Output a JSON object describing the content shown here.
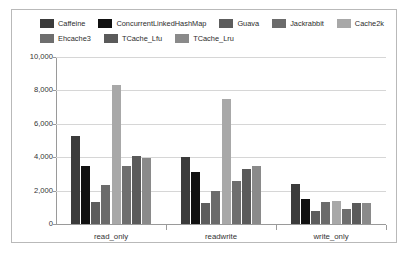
{
  "chart_data": {
    "type": "bar",
    "title": "",
    "xlabel": "",
    "ylabel": "",
    "categories": [
      "read_only",
      "readwrite",
      "write_only"
    ],
    "ylim": [
      0,
      10000
    ],
    "yticks": [
      "0",
      "2,000",
      "4,000",
      "6,000",
      "8,000",
      "10,000"
    ],
    "ytick_values": [
      0,
      2000,
      4000,
      6000,
      8000,
      10000
    ],
    "grid": true,
    "legend_position": "top",
    "series": [
      {
        "name": "Caffeine",
        "color": "#3b3b3b",
        "values": [
          5250,
          4030,
          2420
        ]
      },
      {
        "name": "ConcurrentLinkedHashMap",
        "color": "#111111",
        "values": [
          3500,
          3130,
          1470
        ]
      },
      {
        "name": "Guava",
        "color": "#5d5d5d",
        "values": [
          1300,
          1280,
          800
        ]
      },
      {
        "name": "Jackrabbit",
        "color": "#6b6b6b",
        "values": [
          2350,
          1980,
          1330
        ]
      },
      {
        "name": "Cache2k",
        "color": "#a8a8a8",
        "values": [
          8300,
          7480,
          1400
        ]
      },
      {
        "name": "Ehcache3",
        "color": "#6e6e6e",
        "values": [
          3450,
          2550,
          920
        ]
      },
      {
        "name": "TCache_Lfu",
        "color": "#5a5a5a",
        "values": [
          4050,
          3300,
          1230
        ]
      },
      {
        "name": "TCache_Lru",
        "color": "#8a8a8a",
        "values": [
          3980,
          3480,
          1250
        ]
      }
    ]
  },
  "legend": {
    "row1": [
      "Caffeine",
      "ConcurrentLinkedHashMap",
      "Guava",
      "Jackrabbit",
      "Cache2k"
    ],
    "row2": [
      "Ehcache3",
      "TCache_Lfu",
      "TCache_Lru"
    ]
  }
}
